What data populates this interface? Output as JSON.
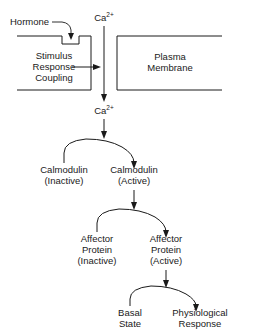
{
  "diagram": {
    "line_color": "#1a1a1a",
    "background_color": "#ffffff",
    "nodes": {
      "hormone": "Hormone",
      "calcium_extracellular": "Ca",
      "calcium_extracellular_charge": "2+",
      "calcium_intracellular": "Ca",
      "calcium_intracellular_charge": "2+",
      "stimulus_line1": "Stimulus",
      "stimulus_line2": "Response",
      "stimulus_line3": "Coupling",
      "plasma_line1": "Plasma",
      "plasma_line2": "Membrane",
      "calmodulin_inactive_line1": "Calmodulin",
      "calmodulin_inactive_line2": "(Inactive)",
      "calmodulin_active_line1": "Calmodulin",
      "calmodulin_active_line2": "(Active)",
      "affector_inactive_line1": "Affector",
      "affector_inactive_line2": "Protein",
      "affector_inactive_line3": "(Inactive)",
      "affector_active_line1": "Affector",
      "affector_active_line2": "Protein",
      "affector_active_line3": "(Active)",
      "basal_line1": "Basal",
      "basal_line2": "State",
      "physiological_line1": "Physiological",
      "physiological_line2": "Response"
    }
  }
}
